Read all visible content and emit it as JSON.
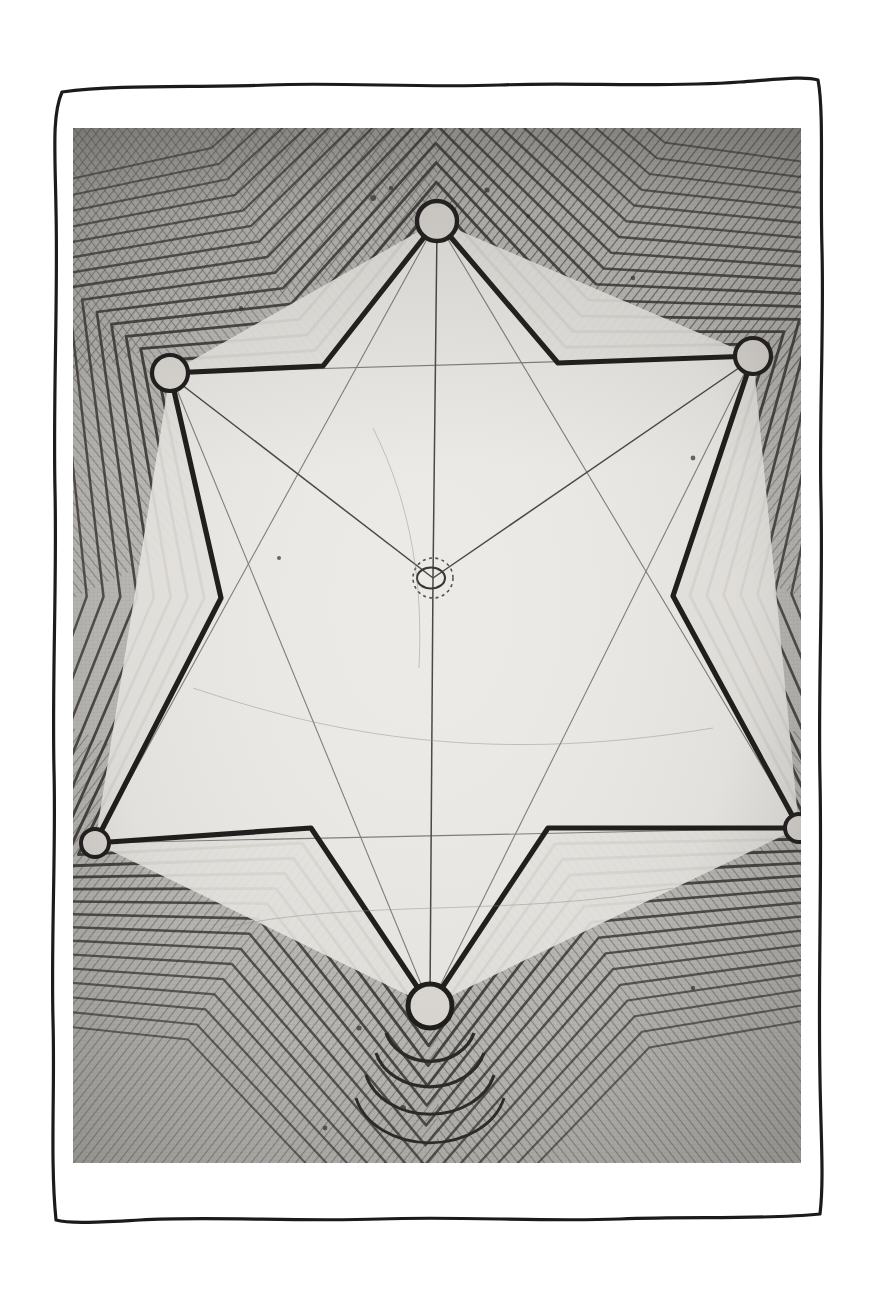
{
  "artwork": {
    "title": "Hand-drawn star polygon contour diagram",
    "medium": "pencil and ink drawing on cloth, photographed",
    "border_style": "hand-drawn wavy rectangle",
    "border_color": "#1a1a1a",
    "background_color": "#ffffff"
  },
  "plate": {
    "x": 73,
    "y": 128,
    "width": 728,
    "height": 1035,
    "paper_color": "#b9b7b3",
    "interior_color": "#e9e7e3",
    "line_color": "#2b2b2b",
    "hatch_color": "#4a4744"
  },
  "chart_data": {
    "type": "diagram",
    "coordinate_space": {
      "width": 728,
      "height": 1035,
      "origin": "top-left of plate"
    },
    "nodes": [
      {
        "id": "n-top",
        "label": "top vertex",
        "x": 364,
        "y": 93,
        "r": 20,
        "ring": true,
        "dashed": false
      },
      {
        "id": "n-upper-left",
        "label": "upper left vertex",
        "x": 97,
        "y": 245,
        "r": 18,
        "ring": true,
        "dashed": false
      },
      {
        "id": "n-upper-right",
        "label": "upper right vertex",
        "x": 680,
        "y": 228,
        "r": 18,
        "ring": true,
        "dashed": false
      },
      {
        "id": "n-lower-left",
        "label": "lower left vertex",
        "x": 22,
        "y": 715,
        "r": 14,
        "ring": true,
        "dashed": false
      },
      {
        "id": "n-lower-right",
        "label": "lower right vertex",
        "x": 726,
        "y": 700,
        "r": 14,
        "ring": true,
        "dashed": false
      },
      {
        "id": "n-bottom",
        "label": "bottom vertex",
        "x": 357,
        "y": 878,
        "r": 22,
        "ring": true,
        "dashed": false
      },
      {
        "id": "n-center",
        "label": "centroid node",
        "x": 360,
        "y": 450,
        "r": 20,
        "ring": true,
        "dashed": true
      }
    ],
    "star_outline": [
      [
        364,
        93
      ],
      [
        485,
        235
      ],
      [
        680,
        228
      ],
      [
        600,
        468
      ],
      [
        726,
        700
      ],
      [
        475,
        700
      ],
      [
        357,
        878
      ],
      [
        238,
        700
      ],
      [
        22,
        715
      ],
      [
        148,
        470
      ],
      [
        97,
        245
      ],
      [
        250,
        238
      ]
    ],
    "inner_polygon": [
      [
        364,
        93
      ],
      [
        680,
        228
      ],
      [
        726,
        700
      ],
      [
        357,
        878
      ],
      [
        22,
        715
      ],
      [
        97,
        245
      ]
    ],
    "spokes": [
      {
        "from": "n-center",
        "to": "n-top",
        "weight": "thin"
      },
      {
        "from": "n-center",
        "to": "n-upper-left",
        "weight": "thin"
      },
      {
        "from": "n-center",
        "to": "n-upper-right",
        "weight": "thin"
      },
      {
        "from": "n-center",
        "to": "n-bottom",
        "weight": "thin"
      }
    ],
    "contour_bands": {
      "count": 14,
      "spacing_px": 13,
      "style": "parallel offset of star outline"
    },
    "hatching": {
      "pattern": "fine parallel diagonal strokes",
      "corners": [
        "top-left",
        "top-right",
        "bottom-left",
        "bottom-right"
      ]
    },
    "legend": [],
    "annotations": [],
    "tick_labels": [],
    "axis_labels": []
  }
}
